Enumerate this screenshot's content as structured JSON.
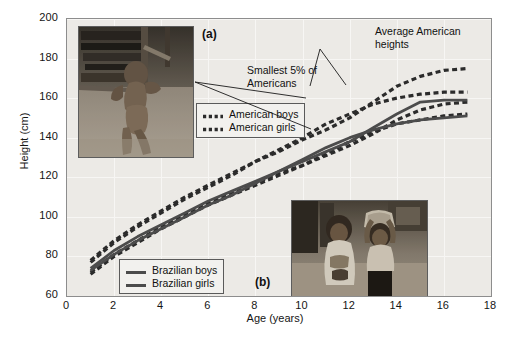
{
  "figure": {
    "panel_a_label": "(a)",
    "panel_b_label": "(b)",
    "photo_a_alt": "malnourished-child-photo",
    "photo_b_alt": "two-children-carrying-basin-photo"
  },
  "legend_american": {
    "title": "american-legend",
    "items": [
      {
        "label": "American boys",
        "style": "dashed",
        "color": "#2b2b2b"
      },
      {
        "label": "American girls",
        "style": "dashed",
        "color": "#2b2b2b"
      }
    ]
  },
  "legend_brazilian": {
    "title": "brazilian-legend",
    "items": [
      {
        "label": "Brazilian boys",
        "style": "solid",
        "color": "#4c4c4c"
      },
      {
        "label": "Brazilian girls",
        "style": "solid",
        "color": "#4c4c4c"
      }
    ]
  },
  "annotations": [
    {
      "name": "average-american-heights",
      "text": "Average American\nheights"
    },
    {
      "name": "smallest-5-percent",
      "text": "Smallest 5% of\nAmericans"
    }
  ],
  "chart_data": {
    "type": "line",
    "title": "",
    "xlabel": "Age (years)",
    "ylabel": "Height (cm)",
    "xlim": [
      0,
      18
    ],
    "ylim": [
      60,
      200
    ],
    "xticks": [
      0,
      2,
      4,
      6,
      8,
      10,
      12,
      14,
      16,
      18
    ],
    "yticks": [
      60,
      80,
      100,
      120,
      140,
      160,
      180,
      200
    ],
    "grid": true,
    "legend_position": "inside",
    "x": [
      1,
      2,
      3,
      4,
      5,
      6,
      7,
      8,
      9,
      10,
      11,
      12,
      13,
      14,
      15,
      16,
      17
    ],
    "series": [
      {
        "name": "American boys average",
        "style": "dashed",
        "color": "#2b2b2b",
        "values": [
          78,
          88,
          96,
          103,
          110,
          116,
          122,
          128,
          133,
          139,
          144,
          150,
          158,
          166,
          171,
          174,
          175
        ]
      },
      {
        "name": "American girls average",
        "style": "dashed",
        "color": "#2b2b2b",
        "values": [
          77,
          87,
          95,
          102,
          109,
          115,
          121,
          128,
          134,
          140,
          147,
          152,
          157,
          160,
          162,
          163,
          163
        ]
      },
      {
        "name": "Smallest 5% of American boys",
        "style": "dashed",
        "color": "#2b2b2b",
        "values": [
          72,
          81,
          88,
          95,
          101,
          107,
          112,
          117,
          122,
          126,
          131,
          136,
          142,
          149,
          154,
          157,
          158
        ]
      },
      {
        "name": "Smallest 5% of American girls",
        "style": "dashed",
        "color": "#2b2b2b",
        "values": [
          71,
          80,
          87,
          94,
          100,
          106,
          111,
          116,
          121,
          126,
          132,
          138,
          143,
          147,
          149,
          151,
          152
        ]
      },
      {
        "name": "Brazilian boys",
        "style": "solid",
        "color": "#4c4c4c",
        "values": [
          74,
          83,
          90,
          96,
          102,
          108,
          113,
          118,
          123,
          128,
          133,
          138,
          145,
          152,
          158,
          159,
          159
        ]
      },
      {
        "name": "Brazilian girls",
        "style": "solid",
        "color": "#4c4c4c",
        "values": [
          73,
          81,
          88,
          94,
          100,
          106,
          111,
          117,
          123,
          129,
          135,
          140,
          144,
          147,
          149,
          150,
          151
        ]
      }
    ]
  }
}
